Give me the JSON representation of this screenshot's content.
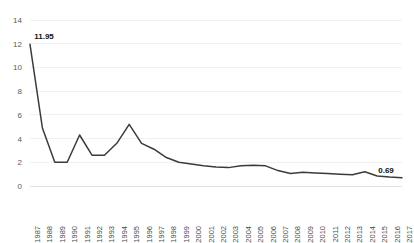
{
  "chart_data": {
    "type": "line",
    "title": "",
    "xlabel": "",
    "ylabel": "",
    "xlim": [
      1987,
      2017
    ],
    "ylim": [
      0,
      14
    ],
    "y_ticks": [
      0,
      2,
      4,
      6,
      8,
      10,
      12,
      14
    ],
    "grid": true,
    "legend": "none",
    "line_color": "#3b3b3b",
    "categories": [
      "1987",
      "1988",
      "1989",
      "1990",
      "1991",
      "1992",
      "1993",
      "1994",
      "1995",
      "1996",
      "1997",
      "1998",
      "1999",
      "2000",
      "2001",
      "2002",
      "2003",
      "2004",
      "2005",
      "2006",
      "2007",
      "2008",
      "2009",
      "2010",
      "2011",
      "2012",
      "2013",
      "2014",
      "2015",
      "2016",
      "2017"
    ],
    "values": [
      11.95,
      4.9,
      2.0,
      2.0,
      4.3,
      2.6,
      2.6,
      3.6,
      5.2,
      3.6,
      3.1,
      2.4,
      2.0,
      1.85,
      1.7,
      1.6,
      1.55,
      1.7,
      1.75,
      1.7,
      1.3,
      1.05,
      1.15,
      1.1,
      1.05,
      1.0,
      0.95,
      1.2,
      0.85,
      0.75,
      0.69
    ],
    "annotations": [
      {
        "name": "first-point-label",
        "category": "1987",
        "value": 11.95,
        "text": "11.95"
      },
      {
        "name": "last-point-label",
        "category": "2017",
        "value": 0.69,
        "text": "0.69"
      }
    ]
  }
}
